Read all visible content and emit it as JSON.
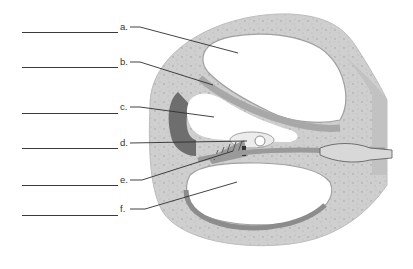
{
  "diagram": {
    "type": "labeling-worksheet",
    "labels": [
      {
        "id": "a",
        "text": "a.",
        "blank_y": 32,
        "label_y": 22,
        "leader": [
          [
            130,
            27
          ],
          [
            140,
            27
          ],
          [
            238,
            53
          ]
        ]
      },
      {
        "id": "b",
        "text": "b.",
        "blank_y": 67,
        "label_y": 57,
        "leader": [
          [
            130,
            62
          ],
          [
            140,
            62
          ],
          [
            213,
            85
          ]
        ]
      },
      {
        "id": "c",
        "text": "c.",
        "blank_y": 113,
        "label_y": 102,
        "leader": [
          [
            130,
            107
          ],
          [
            140,
            107
          ],
          [
            214,
            117
          ]
        ]
      },
      {
        "id": "d",
        "text": "d.",
        "blank_y": 148,
        "label_y": 138,
        "leader": [
          [
            130,
            143
          ],
          [
            247,
            141
          ]
        ]
      },
      {
        "id": "e",
        "text": "e.",
        "blank_y": 185,
        "label_y": 175,
        "leader": [
          [
            130,
            180
          ],
          [
            142,
            180
          ],
          [
            233,
            151
          ]
        ]
      },
      {
        "id": "f",
        "text": "f.",
        "blank_y": 215,
        "label_y": 204,
        "leader": [
          [
            130,
            209
          ],
          [
            145,
            209
          ],
          [
            237,
            182
          ]
        ]
      }
    ],
    "colors": {
      "background": "#ffffff",
      "bone": "#cfcfcf",
      "bone_shade": "#b8b8b8",
      "membrane": "#a9a9a9",
      "dark_wall": "#6e6e6e",
      "duct_fill": "#e6e6e6",
      "line": "#3a3a3a"
    }
  }
}
